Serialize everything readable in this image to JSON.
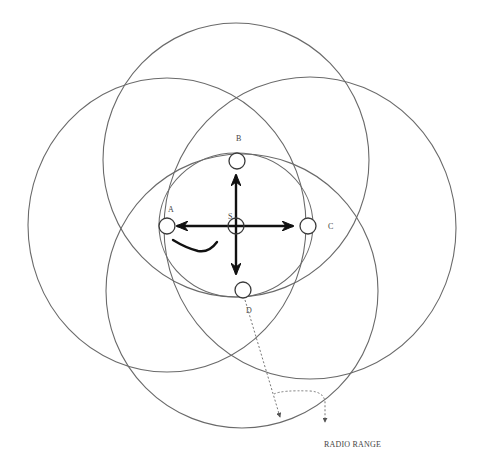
{
  "diagram": {
    "type": "radio-range-topology",
    "colors": {
      "circle_stroke": "#6a6a6a",
      "node_stroke": "#3a3a3a",
      "arrow": "#111111",
      "text": "#444444",
      "background": "#ffffff"
    },
    "range_circles": [
      {
        "id": "range-B",
        "cx": 236,
        "cy": 160,
        "rx": 133,
        "ry": 137
      },
      {
        "id": "range-A",
        "cx": 167,
        "cy": 225,
        "rx": 139,
        "ry": 147
      },
      {
        "id": "range-C",
        "cx": 310,
        "cy": 228,
        "rx": 146,
        "ry": 151
      },
      {
        "id": "range-D",
        "cx": 242,
        "cy": 291,
        "rx": 136,
        "ry": 137
      },
      {
        "id": "range-S",
        "cx": 236,
        "cy": 225,
        "rx": 77,
        "ry": 72
      }
    ],
    "nodes": [
      {
        "id": "S",
        "label": "S",
        "cx": 236,
        "cy": 226,
        "r": 8,
        "label_x": 228,
        "label_y": 217
      },
      {
        "id": "A",
        "label": "A",
        "cx": 167,
        "cy": 226,
        "r": 8,
        "label_x": 170,
        "label_y": 211
      },
      {
        "id": "B",
        "label": "B",
        "cx": 237,
        "cy": 161,
        "r": 8,
        "label_x": 238,
        "label_y": 140
      },
      {
        "id": "C",
        "label": "C",
        "cx": 308,
        "cy": 226,
        "r": 8,
        "label_x": 330,
        "label_y": 229
      },
      {
        "id": "D",
        "label": "D",
        "cx": 243,
        "cy": 290,
        "r": 8,
        "label_x": 248,
        "label_y": 312
      }
    ],
    "labels": {
      "S": "S",
      "A": "A",
      "B": "B",
      "C": "C",
      "D": "D",
      "radio_range": "RADIO RANGE"
    }
  }
}
